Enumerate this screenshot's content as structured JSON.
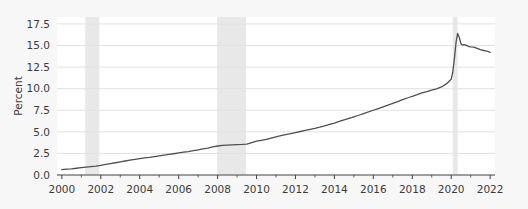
{
  "figure": {
    "background_color": "#f7f7f7",
    "plot_background_color": "#ffffff",
    "frame_color": "#cccccc"
  },
  "axes": {
    "y_title": "Percent",
    "y_ticks": [
      "0.0",
      "2.5",
      "5.0",
      "7.5",
      "10.0",
      "12.5",
      "15.0",
      "17.5"
    ],
    "x_ticks": [
      "2000",
      "2002",
      "2004",
      "2006",
      "2008",
      "2010",
      "2012",
      "2014",
      "2016",
      "2018",
      "2020",
      "2022"
    ],
    "axis_line_color": "#4d4d4d",
    "grid_color": "#e2e2e2",
    "tick_label_color": "#3b3b3b"
  },
  "series_style": {
    "line_color": "#4f4f4f",
    "line_width": 1.3
  },
  "shading_style": {
    "band_color": "#e8e8e8"
  },
  "chart_data": {
    "type": "line",
    "title": "",
    "subtitle": "",
    "xlabel": "",
    "ylabel": "Percent",
    "xlim": [
      1999.75,
      2022.25
    ],
    "ylim": [
      0.0,
      18.3
    ],
    "grid": true,
    "legend": false,
    "x_tick_values": [
      2000,
      2002,
      2004,
      2006,
      2008,
      2010,
      2012,
      2014,
      2016,
      2018,
      2020,
      2022
    ],
    "x_minor_tick_values": [
      2001,
      2003,
      2005,
      2007,
      2009,
      2011,
      2013,
      2015,
      2017,
      2019,
      2021
    ],
    "y_tick_values": [
      0.0,
      2.5,
      5.0,
      7.5,
      10.0,
      12.5,
      15.0,
      17.5
    ],
    "shaded_regions": [
      {
        "label": "recession-2001",
        "x_start": 2001.2,
        "x_end": 2001.92
      },
      {
        "label": "recession-2008",
        "x_start": 2007.98,
        "x_end": 2009.46
      },
      {
        "label": "recession-2020",
        "x_start": 2020.08,
        "x_end": 2020.33
      }
    ],
    "series": [
      {
        "name": "Percent",
        "x": [
          2000.0,
          2000.25,
          2000.5,
          2000.75,
          2001.0,
          2001.25,
          2001.5,
          2001.75,
          2002.0,
          2002.25,
          2002.5,
          2002.75,
          2003.0,
          2003.25,
          2003.5,
          2003.75,
          2004.0,
          2004.25,
          2004.5,
          2004.75,
          2005.0,
          2005.25,
          2005.5,
          2005.75,
          2006.0,
          2006.25,
          2006.5,
          2006.75,
          2007.0,
          2007.25,
          2007.5,
          2007.75,
          2008.0,
          2008.25,
          2008.5,
          2008.75,
          2009.0,
          2009.25,
          2009.5,
          2009.75,
          2010.0,
          2010.25,
          2010.5,
          2010.75,
          2011.0,
          2011.25,
          2011.5,
          2011.75,
          2012.0,
          2012.25,
          2012.5,
          2012.75,
          2013.0,
          2013.25,
          2013.5,
          2013.75,
          2014.0,
          2014.25,
          2014.5,
          2014.75,
          2015.0,
          2015.25,
          2015.5,
          2015.75,
          2016.0,
          2016.25,
          2016.5,
          2016.75,
          2017.0,
          2017.25,
          2017.5,
          2017.75,
          2018.0,
          2018.25,
          2018.5,
          2018.75,
          2019.0,
          2019.25,
          2019.5,
          2019.75,
          2020.0,
          2020.08,
          2020.17,
          2020.25,
          2020.33,
          2020.42,
          2020.5,
          2020.58,
          2020.67,
          2020.75,
          2020.83,
          2020.92,
          2021.0,
          2021.17,
          2021.33,
          2021.5,
          2021.67,
          2021.83,
          2022.0
        ],
        "values": [
          0.62,
          0.68,
          0.72,
          0.78,
          0.85,
          0.92,
          0.98,
          1.02,
          1.12,
          1.22,
          1.32,
          1.42,
          1.52,
          1.62,
          1.72,
          1.8,
          1.9,
          1.98,
          2.05,
          2.14,
          2.22,
          2.3,
          2.38,
          2.46,
          2.55,
          2.64,
          2.72,
          2.82,
          2.92,
          3.02,
          3.12,
          3.25,
          3.36,
          3.42,
          3.46,
          3.5,
          3.52,
          3.54,
          3.58,
          3.76,
          3.92,
          4.02,
          4.12,
          4.28,
          4.42,
          4.56,
          4.68,
          4.8,
          4.92,
          5.04,
          5.16,
          5.28,
          5.4,
          5.54,
          5.7,
          5.86,
          6.02,
          6.2,
          6.38,
          6.56,
          6.74,
          6.92,
          7.12,
          7.3,
          7.5,
          7.7,
          7.9,
          8.1,
          8.3,
          8.5,
          8.72,
          8.92,
          9.12,
          9.3,
          9.5,
          9.66,
          9.84,
          9.98,
          10.2,
          10.55,
          11.1,
          11.9,
          13.6,
          15.4,
          16.4,
          15.9,
          15.2,
          15.05,
          15.1,
          15.05,
          14.95,
          14.88,
          14.85,
          14.8,
          14.66,
          14.52,
          14.42,
          14.36,
          14.2
        ]
      }
    ]
  }
}
